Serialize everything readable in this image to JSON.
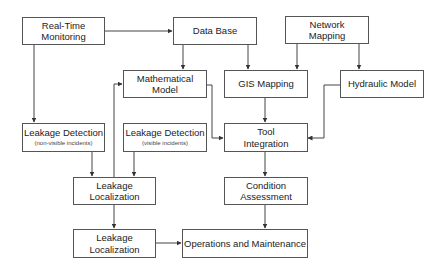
{
  "diagram": {
    "nodes": {
      "realtime": {
        "line1": "Real-Time",
        "line2": "Monitoring"
      },
      "database": {
        "line1": "Data Base"
      },
      "network": {
        "line1": "Network",
        "line2": "Mapping"
      },
      "math": {
        "line1": "Mathematical",
        "line2": "Model"
      },
      "gis": {
        "line1": "GIS Mapping"
      },
      "hydraulic": {
        "line1": "Hydraulic Model"
      },
      "detect_nonvisible": {
        "line1": "Leakage Detection",
        "line2": "(non-visible incidents)"
      },
      "detect_visible": {
        "line1": "Leakage Detection",
        "line2": "(visible incidents)"
      },
      "tool": {
        "line1": "Tool",
        "line2": "Integration"
      },
      "localization1": {
        "line1": "Leakage",
        "line2": "Localization"
      },
      "condition": {
        "line1": "Condition",
        "line2": "Assessment"
      },
      "localization2": {
        "line1": "Leakage",
        "line2": "Localization"
      },
      "operations": {
        "line1": "Operations and Maintenance"
      }
    },
    "edges": [
      {
        "from": "Real-Time Monitoring",
        "to": "Data Base"
      },
      {
        "from": "Real-Time Monitoring",
        "to": "Leakage Detection (non-visible incidents)"
      },
      {
        "from": "Data Base",
        "to": "Mathematical Model"
      },
      {
        "from": "Data Base",
        "to": "GIS Mapping"
      },
      {
        "from": "Network Mapping",
        "to": "GIS Mapping"
      },
      {
        "from": "Network Mapping",
        "to": "Hydraulic Model"
      },
      {
        "from": "Mathematical Model",
        "to": "Tool Integration"
      },
      {
        "from": "GIS Mapping",
        "to": "Tool Integration"
      },
      {
        "from": "Hydraulic Model",
        "to": "Tool Integration"
      },
      {
        "from": "Leakage Detection (non-visible incidents)",
        "to": "Leakage Localization"
      },
      {
        "from": "Leakage Detection (visible incidents)",
        "to": "Leakage Localization"
      },
      {
        "from": "Leakage Localization",
        "to": "Mathematical Model"
      },
      {
        "from": "Leakage Localization",
        "to": "Leakage Localization (lower)"
      },
      {
        "from": "Tool Integration",
        "to": "Condition Assessment"
      },
      {
        "from": "Condition Assessment",
        "to": "Operations and Maintenance"
      },
      {
        "from": "Leakage Localization (lower)",
        "to": "Operations and Maintenance"
      }
    ]
  }
}
